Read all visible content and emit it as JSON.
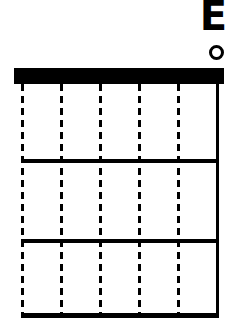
{
  "chord": {
    "name": "E",
    "open_marker": "o",
    "open_string_index": 5
  },
  "diagram": {
    "strings": 6,
    "frets_shown": 3,
    "string_styles": [
      "dashed",
      "dashed",
      "dashed",
      "dashed",
      "dashed",
      "solid"
    ],
    "colors": {
      "ink": "#000000",
      "background": "#ffffff"
    }
  }
}
